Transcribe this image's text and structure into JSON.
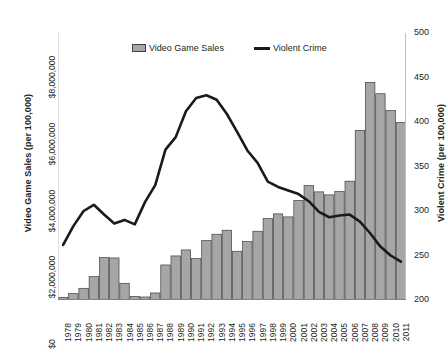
{
  "chart_data": {
    "type": "bar",
    "title": "",
    "subtitle": "",
    "xlabel": "",
    "ylabel": "Video Game Sales (per 100,000)",
    "y2label": "Violent Crime (per 100,000)",
    "grid": false,
    "legend_position": "top-center",
    "categories": [
      "1978",
      "1979",
      "1980",
      "1981",
      "1982",
      "1983",
      "1984",
      "1985",
      "1986",
      "1987",
      "1988",
      "1989",
      "1990",
      "1991",
      "1992",
      "1993",
      "1994",
      "1995",
      "1996",
      "1997",
      "1998",
      "1999",
      "2000",
      "2001",
      "2002",
      "2003",
      "2004",
      "2005",
      "2006",
      "2007",
      "2008",
      "2009",
      "2010",
      "2011"
    ],
    "ylim": [
      0,
      8000000
    ],
    "yticks": [
      0,
      2000000,
      4000000,
      6000000,
      8000000
    ],
    "ytick_labels": [
      "$0",
      "$2,000,000",
      "$4,000,000",
      "$6,000,000",
      "$8,000,000"
    ],
    "y2lim": [
      200,
      500
    ],
    "y2ticks": [
      200,
      250,
      300,
      350,
      400,
      450,
      500
    ],
    "y2tick_labels": [
      "200",
      "250",
      "300",
      "350",
      "400",
      "450",
      "500"
    ],
    "series": [
      {
        "name": "Video Game Sales",
        "type": "bar",
        "axis": "left",
        "color": "#a6a6a6",
        "edge_color": "#404040",
        "values": [
          80000,
          190000,
          350000,
          700000,
          1270000,
          1260000,
          500000,
          110000,
          90000,
          210000,
          1050000,
          1320000,
          1500000,
          1240000,
          1780000,
          1970000,
          2090000,
          1460000,
          1750000,
          2060000,
          2440000,
          2580000,
          2490000,
          2980000,
          3430000,
          3240000,
          3150000,
          3250000,
          3560000,
          5080000,
          6520000,
          6180000,
          5680000,
          5320000
        ]
      },
      {
        "name": "Violent Crime",
        "type": "line",
        "axis": "right",
        "color": "#1a1a1a",
        "values": [
          262,
          283,
          300,
          307,
          296,
          286,
          290,
          285,
          310,
          329,
          369,
          383,
          412,
          427,
          430,
          425,
          409,
          389,
          368,
          354,
          333,
          327,
          323,
          319,
          311,
          299,
          293,
          295,
          296,
          288,
          275,
          260,
          250,
          243
        ]
      }
    ]
  },
  "legend": {
    "items": [
      {
        "label": "Video Game Sales",
        "marker": "bar-swatch"
      },
      {
        "label": "Violent Crime",
        "marker": "line-swatch"
      }
    ]
  }
}
